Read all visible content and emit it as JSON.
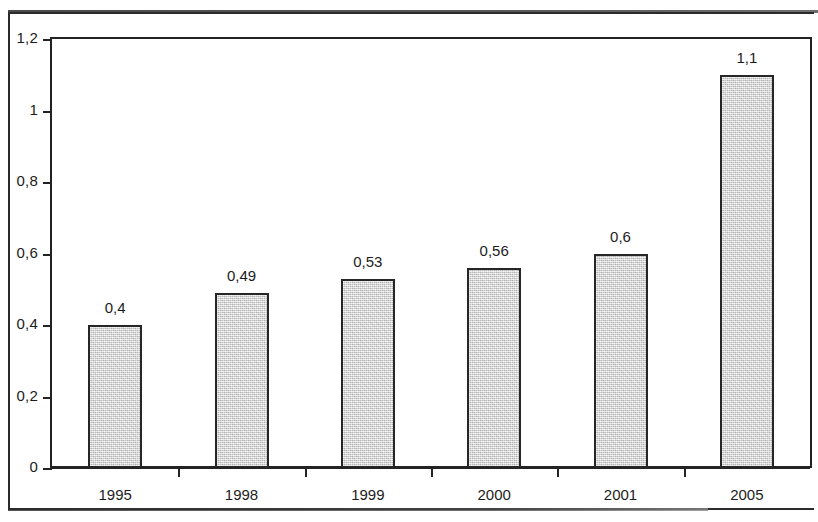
{
  "chart_data": {
    "type": "bar",
    "title": "",
    "subtitle": "",
    "xlabel": "",
    "ylabel": "",
    "categories": [
      "1995",
      "1998",
      "1999",
      "2000",
      "2001",
      "2005"
    ],
    "values": [
      0.4,
      0.49,
      0.53,
      0.56,
      0.6,
      1.1
    ],
    "value_labels": [
      "0,4",
      "0,49",
      "0,53",
      "0,56",
      "0,6",
      "1,1"
    ],
    "ylim": [
      0,
      1.2
    ],
    "ytick_values": [
      0,
      0.2,
      0.4,
      0.6,
      0.8,
      1.0,
      1.2
    ],
    "ytick_labels": [
      "0",
      "0,2",
      "0,4",
      "0,6",
      "0,8",
      "1",
      "1,2"
    ],
    "decimal_separator": ",",
    "grid": false,
    "legend": null,
    "legend_position": "none",
    "series": [
      {
        "name": "",
        "values": [
          0.4,
          0.49,
          0.53,
          0.56,
          0.6,
          1.1
        ]
      }
    ],
    "colors": {
      "bar_fill": "#d4d4d4",
      "bar_border": "#262626",
      "axis": "#232323",
      "text": "#1c1c1c",
      "background": "#ffffff"
    }
  }
}
